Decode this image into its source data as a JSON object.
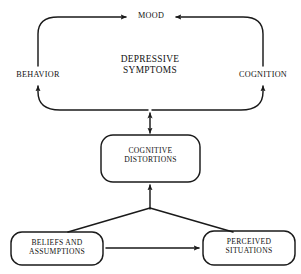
{
  "diagram": {
    "stroke_color": "#1a1a1a",
    "background_color": "#ffffff",
    "cycle": {
      "center_text": "DEPRESSIVE\nSYMPTOMS",
      "nodes": [
        {
          "id": "mood",
          "label": "MOOD"
        },
        {
          "id": "behavior",
          "label": "BEHAVIOR"
        },
        {
          "id": "cognition",
          "label": "COGNITION"
        }
      ]
    },
    "boxes": [
      {
        "id": "cognitive-distortions",
        "label": "COGNITIVE\nDISTORTIONS"
      },
      {
        "id": "beliefs-and-assumptions",
        "label": "BELIEFS AND\nASSUMPTIONS"
      },
      {
        "id": "perceived-situations",
        "label": "PERCEIVED\nSITUATIONS"
      }
    ],
    "connections": [
      {
        "from": "behavior",
        "to": "mood",
        "type": "curved-arrow",
        "direction": "one-way"
      },
      {
        "from": "cognition",
        "to": "mood",
        "type": "curved-arrow",
        "direction": "one-way"
      },
      {
        "from": "mood",
        "to": "behavior",
        "type": "curved-arrow",
        "direction": "one-way"
      },
      {
        "from": "mood",
        "to": "cognition",
        "type": "curved-arrow",
        "direction": "one-way"
      },
      {
        "from": "cognitive-distortions",
        "to": "behavior",
        "type": "curved-arrow",
        "direction": "one-way"
      },
      {
        "from": "cognitive-distortions",
        "to": "cognition",
        "type": "curved-arrow",
        "direction": "one-way"
      },
      {
        "from": "cycle",
        "to": "cognitive-distortions",
        "type": "straight-arrow",
        "direction": "two-way"
      },
      {
        "from": "beliefs-and-assumptions",
        "to": "cognitive-distortions",
        "type": "diagonal-arrow",
        "direction": "one-way"
      },
      {
        "from": "perceived-situations",
        "to": "cognitive-distortions",
        "type": "diagonal-arrow",
        "direction": "one-way"
      },
      {
        "from": "beliefs-and-assumptions",
        "to": "perceived-situations",
        "type": "straight-arrow",
        "direction": "one-way"
      }
    ]
  }
}
